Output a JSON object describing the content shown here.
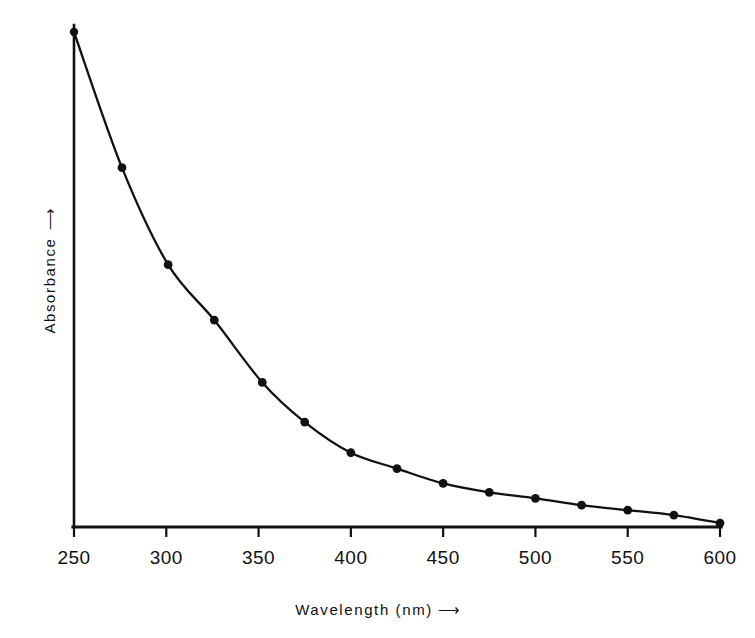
{
  "chart_data": {
    "type": "line",
    "title": "",
    "subtitle": "",
    "xlabel": "Wavelength (nm)",
    "ylabel": "Absorbance",
    "xlabel_arrow": "⟶",
    "ylabel_arrow": "⟶",
    "grid": false,
    "legend": "none",
    "xlim": [
      250,
      600
    ],
    "ylim": [
      0,
      1
    ],
    "xticks": [
      250,
      300,
      350,
      400,
      450,
      500,
      550,
      600
    ],
    "xtick_labels": [
      "250",
      "300",
      "350",
      "400",
      "450",
      "500",
      "550",
      "600"
    ],
    "yticks": [],
    "ytick_labels": [],
    "y_axis_note": "unlabeled arbitrary absorbance units, increasing upward",
    "x": [
      250,
      276,
      301,
      326,
      352,
      375,
      400,
      425,
      450,
      475,
      500,
      525,
      550,
      575,
      600
    ],
    "values": [
      1.0,
      0.726,
      0.53,
      0.418,
      0.292,
      0.212,
      0.15,
      0.118,
      0.088,
      0.07,
      0.058,
      0.044,
      0.034,
      0.024,
      0.008
    ],
    "series": [
      {
        "name": "Absorbance spectrum",
        "marker": "filled-circle",
        "line_style": "solid",
        "color": "#111111",
        "values": [
          1.0,
          0.726,
          0.53,
          0.418,
          0.292,
          0.212,
          0.15,
          0.118,
          0.088,
          0.07,
          0.058,
          0.044,
          0.034,
          0.024,
          0.008
        ]
      }
    ],
    "annotations": []
  },
  "axes": {
    "x_title": "Wavelength (nm)",
    "y_title": "Absorbance",
    "arrow": "⟶"
  },
  "ticks": {
    "x": [
      {
        "label": "250"
      },
      {
        "label": "300"
      },
      {
        "label": "350"
      },
      {
        "label": "400"
      },
      {
        "label": "450"
      },
      {
        "label": "500"
      },
      {
        "label": "550"
      },
      {
        "label": "600"
      }
    ]
  },
  "colors": {
    "ink": "#111111",
    "background": "#ffffff"
  }
}
